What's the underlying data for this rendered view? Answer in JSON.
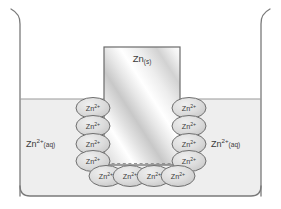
{
  "figure": {
    "width": 281,
    "height": 209
  },
  "electrode": {
    "name": "zinc-electrode",
    "label_main": "Zn",
    "label_sub": "(s)",
    "fill_light": "#ffffff",
    "fill_dark": "#c9c9c9",
    "stroke": "#6b6b6b"
  },
  "beaker": {
    "name": "beaker",
    "stroke": "#7a7a7a",
    "solution_fill": "#eeeeee",
    "solution_line": "#9a9a9a"
  },
  "solution": {
    "left_label": {
      "base": "Zn",
      "charge": "2+",
      "state": "(aq)"
    },
    "right_label": {
      "base": "Zn",
      "charge": "2+",
      "state": "(aq)"
    }
  },
  "ion": {
    "base": "Zn",
    "charge": "2+",
    "fill": "#d8d8d8",
    "stroke": "#6f6f6f"
  },
  "ions_left": [
    {
      "cx": 93,
      "cy": 108
    },
    {
      "cx": 93,
      "cy": 126
    },
    {
      "cx": 93,
      "cy": 144
    },
    {
      "cx": 93,
      "cy": 161
    }
  ],
  "ions_right": [
    {
      "cx": 189,
      "cy": 108
    },
    {
      "cx": 189,
      "cy": 126
    },
    {
      "cx": 189,
      "cy": 144
    },
    {
      "cx": 189,
      "cy": 161
    }
  ],
  "ions_bottom": [
    {
      "cx": 106,
      "cy": 176
    },
    {
      "cx": 130,
      "cy": 176
    },
    {
      "cx": 154,
      "cy": 176
    },
    {
      "cx": 178,
      "cy": 176
    }
  ]
}
